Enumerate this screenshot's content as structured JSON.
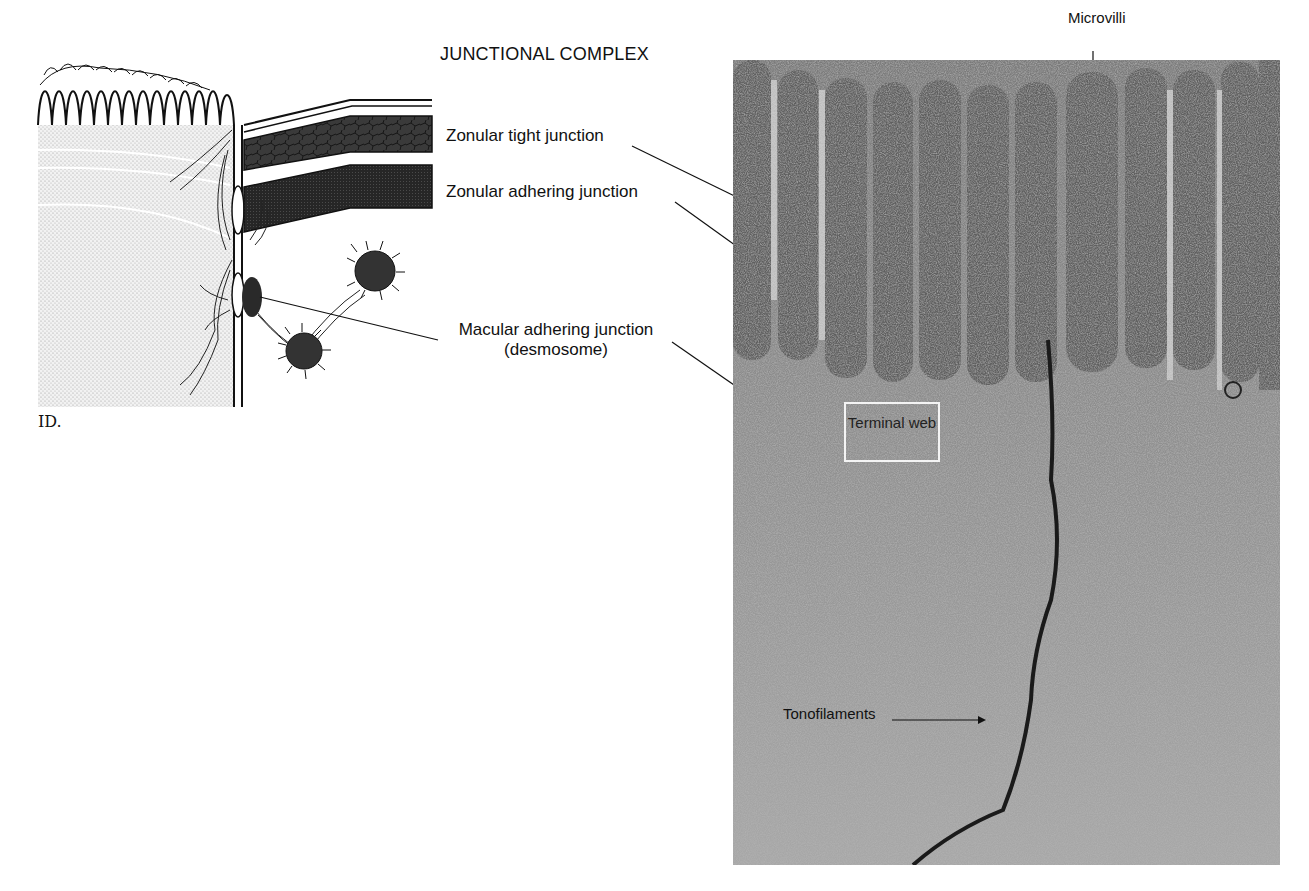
{
  "figure": {
    "title": "JUNCTIONAL COMPLEX",
    "labels": {
      "zonular_tight": "Zonular tight junction",
      "zonular_adhering": "Zonular adhering junction",
      "macular_adhering": "Macular adhering junction",
      "macular_adhering_sub": "(desmosome)",
      "microvilli": "Microvilli",
      "terminal_web": "Terminal web",
      "tonofilaments": "Tonofilaments"
    },
    "artist_signature": "ID."
  }
}
